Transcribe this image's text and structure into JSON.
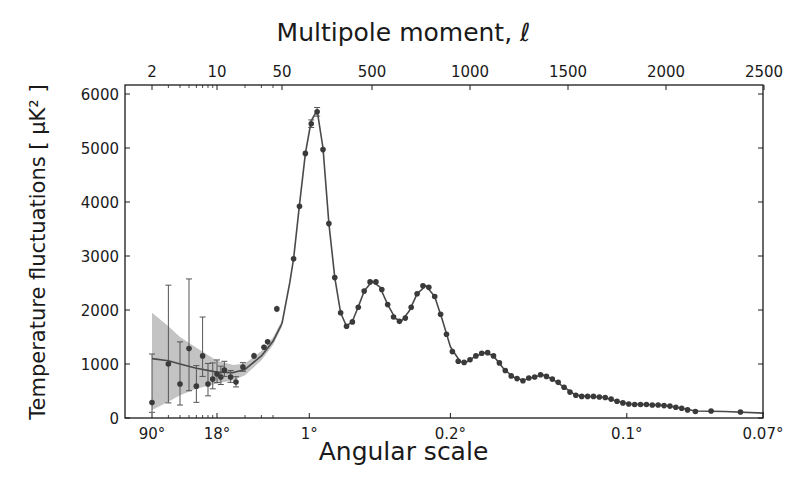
{
  "chart_data": {
    "type": "scatter",
    "title": "Multipole moment, ℓ",
    "top_xlabel": "Multipole moment, ℓ",
    "xlabel": "Angular scale",
    "ylabel": "Temperature fluctuations [ μK² ]",
    "ylim": [
      0,
      6200
    ],
    "xscale": "log for ℓ ≤ 50, linear for ℓ > 50",
    "xlim": [
      2,
      2500
    ],
    "grid": false,
    "top_ticks": [
      {
        "label": "2",
        "l": 2
      },
      {
        "label": "10",
        "l": 10
      },
      {
        "label": "50",
        "l": 50
      },
      {
        "label": "500",
        "l": 500
      },
      {
        "label": "1000",
        "l": 1000
      },
      {
        "label": "1500",
        "l": 1500
      },
      {
        "label": "2000",
        "l": 2000
      },
      {
        "label": "2500",
        "l": 2500
      }
    ],
    "bottom_ticks": [
      {
        "label": "90°",
        "l": 2
      },
      {
        "label": "18°",
        "l": 10
      },
      {
        "label": "1°",
        "l": 180
      },
      {
        "label": "0.2°",
        "l": 900
      },
      {
        "label": "0.1°",
        "l": 1800
      },
      {
        "label": "0.07°",
        "l": 2500
      }
    ],
    "y_ticks": [
      0,
      1000,
      2000,
      3000,
      4000,
      5000,
      6000
    ],
    "series": [
      {
        "name": "Measured power spectrum (data points with error bars)",
        "style": "dark gray circles",
        "points": [
          {
            "l": 2,
            "D": 285,
            "err_lo": 180,
            "err_hi": 900
          },
          {
            "l": 3,
            "D": 1000,
            "err_lo": 720,
            "err_hi": 1460
          },
          {
            "l": 4,
            "D": 630,
            "err_lo": 390,
            "err_hi": 780
          },
          {
            "l": 5,
            "D": 1285,
            "err_lo": 780,
            "err_hi": 1290
          },
          {
            "l": 6,
            "D": 590,
            "err_lo": 300,
            "err_hi": 380
          },
          {
            "l": 7,
            "D": 1150,
            "err_lo": 380,
            "err_hi": 720
          },
          {
            "l": 8,
            "D": 630,
            "err_lo": 220,
            "err_hi": 380
          },
          {
            "l": 9,
            "D": 720,
            "err_lo": 180,
            "err_hi": 300
          },
          {
            "l": 10,
            "D": 815,
            "err_lo": 160,
            "err_hi": 260
          },
          {
            "l": 11,
            "D": 760,
            "err_lo": 140,
            "err_hi": 200
          },
          {
            "l": 12,
            "D": 890,
            "err_lo": 120,
            "err_hi": 160
          },
          {
            "l": 14,
            "D": 760,
            "err_lo": 100,
            "err_hi": 120
          },
          {
            "l": 16,
            "D": 665,
            "err_lo": 90,
            "err_hi": 100
          },
          {
            "l": 19,
            "D": 945,
            "err_lo": 80,
            "err_hi": 80
          },
          {
            "l": 25,
            "D": 1150,
            "err_lo": 60,
            "err_hi": 60
          },
          {
            "l": 32,
            "D": 1310,
            "err_lo": 50,
            "err_hi": 50
          },
          {
            "l": 35,
            "D": 1410,
            "err_lo": 50,
            "err_hi": 50
          },
          {
            "l": 44,
            "D": 2020,
            "err_lo": 60,
            "err_hi": 60
          },
          {
            "l": 100,
            "D": 2950,
            "err_lo": 50,
            "err_hi": 50
          },
          {
            "l": 130,
            "D": 3920,
            "err_lo": 60,
            "err_hi": 60
          },
          {
            "l": 160,
            "D": 4900,
            "err_lo": 60,
            "err_hi": 60
          },
          {
            "l": 190,
            "D": 5450,
            "err_lo": 70,
            "err_hi": 70
          },
          {
            "l": 220,
            "D": 5670,
            "err_lo": 80,
            "err_hi": 80
          },
          {
            "l": 250,
            "D": 4970,
            "err_lo": 60,
            "err_hi": 60
          },
          {
            "l": 280,
            "D": 3600,
            "err_lo": 50,
            "err_hi": 50
          },
          {
            "l": 310,
            "D": 2600,
            "err_lo": 40,
            "err_hi": 40
          },
          {
            "l": 340,
            "D": 1950,
            "err_lo": 40,
            "err_hi": 40
          },
          {
            "l": 370,
            "D": 1700,
            "err_lo": 30,
            "err_hi": 30
          },
          {
            "l": 400,
            "D": 1780,
            "err_lo": 30,
            "err_hi": 30
          },
          {
            "l": 430,
            "D": 2050,
            "err_lo": 30,
            "err_hi": 30
          },
          {
            "l": 460,
            "D": 2350,
            "err_lo": 30,
            "err_hi": 30
          },
          {
            "l": 490,
            "D": 2520,
            "err_lo": 30,
            "err_hi": 30
          },
          {
            "l": 520,
            "D": 2520,
            "err_lo": 30,
            "err_hi": 30
          },
          {
            "l": 550,
            "D": 2380,
            "err_lo": 30,
            "err_hi": 30
          },
          {
            "l": 580,
            "D": 2100,
            "err_lo": 30,
            "err_hi": 30
          },
          {
            "l": 610,
            "D": 1870,
            "err_lo": 30,
            "err_hi": 30
          },
          {
            "l": 640,
            "D": 1790,
            "err_lo": 30,
            "err_hi": 30
          },
          {
            "l": 670,
            "D": 1850,
            "err_lo": 30,
            "err_hi": 30
          },
          {
            "l": 700,
            "D": 2050,
            "err_lo": 30,
            "err_hi": 30
          },
          {
            "l": 730,
            "D": 2300,
            "err_lo": 30,
            "err_hi": 30
          },
          {
            "l": 760,
            "D": 2450,
            "err_lo": 30,
            "err_hi": 30
          },
          {
            "l": 790,
            "D": 2420,
            "err_lo": 30,
            "err_hi": 30
          },
          {
            "l": 820,
            "D": 2250,
            "err_lo": 30,
            "err_hi": 30
          },
          {
            "l": 850,
            "D": 1920,
            "err_lo": 30,
            "err_hi": 30
          },
          {
            "l": 880,
            "D": 1550,
            "err_lo": 30,
            "err_hi": 30
          },
          {
            "l": 910,
            "D": 1230,
            "err_lo": 30,
            "err_hi": 30
          },
          {
            "l": 940,
            "D": 1050,
            "err_lo": 30,
            "err_hi": 30
          },
          {
            "l": 970,
            "D": 1030,
            "err_lo": 30,
            "err_hi": 30
          },
          {
            "l": 1000,
            "D": 1080,
            "err_lo": 30,
            "err_hi": 30
          },
          {
            "l": 1030,
            "D": 1150,
            "err_lo": 30,
            "err_hi": 30
          },
          {
            "l": 1060,
            "D": 1200,
            "err_lo": 30,
            "err_hi": 30
          },
          {
            "l": 1090,
            "D": 1210,
            "err_lo": 30,
            "err_hi": 30
          },
          {
            "l": 1120,
            "D": 1150,
            "err_lo": 30,
            "err_hi": 30
          },
          {
            "l": 1150,
            "D": 1020,
            "err_lo": 30,
            "err_hi": 30
          },
          {
            "l": 1180,
            "D": 880,
            "err_lo": 30,
            "err_hi": 30
          },
          {
            "l": 1210,
            "D": 780,
            "err_lo": 30,
            "err_hi": 30
          },
          {
            "l": 1240,
            "D": 730,
            "err_lo": 30,
            "err_hi": 30
          },
          {
            "l": 1270,
            "D": 690,
            "err_lo": 30,
            "err_hi": 30
          },
          {
            "l": 1300,
            "D": 740,
            "err_lo": 30,
            "err_hi": 30
          },
          {
            "l": 1330,
            "D": 760,
            "err_lo": 30,
            "err_hi": 30
          },
          {
            "l": 1360,
            "D": 800,
            "err_lo": 30,
            "err_hi": 30
          },
          {
            "l": 1390,
            "D": 770,
            "err_lo": 30,
            "err_hi": 30
          },
          {
            "l": 1420,
            "D": 720,
            "err_lo": 30,
            "err_hi": 30
          },
          {
            "l": 1450,
            "D": 660,
            "err_lo": 30,
            "err_hi": 30
          },
          {
            "l": 1480,
            "D": 570,
            "err_lo": 30,
            "err_hi": 30
          },
          {
            "l": 1510,
            "D": 480,
            "err_lo": 30,
            "err_hi": 30
          },
          {
            "l": 1540,
            "D": 420,
            "err_lo": 30,
            "err_hi": 30
          },
          {
            "l": 1570,
            "D": 400,
            "err_lo": 30,
            "err_hi": 30
          },
          {
            "l": 1600,
            "D": 400,
            "err_lo": 30,
            "err_hi": 30
          },
          {
            "l": 1630,
            "D": 400,
            "err_lo": 30,
            "err_hi": 30
          },
          {
            "l": 1660,
            "D": 390,
            "err_lo": 30,
            "err_hi": 30
          },
          {
            "l": 1690,
            "D": 380,
            "err_lo": 30,
            "err_hi": 30
          },
          {
            "l": 1720,
            "D": 350,
            "err_lo": 30,
            "err_hi": 30
          },
          {
            "l": 1750,
            "D": 310,
            "err_lo": 30,
            "err_hi": 30
          },
          {
            "l": 1780,
            "D": 280,
            "err_lo": 30,
            "err_hi": 30
          },
          {
            "l": 1810,
            "D": 260,
            "err_lo": 30,
            "err_hi": 30
          },
          {
            "l": 1840,
            "D": 250,
            "err_lo": 30,
            "err_hi": 30
          },
          {
            "l": 1870,
            "D": 250,
            "err_lo": 30,
            "err_hi": 30
          },
          {
            "l": 1900,
            "D": 250,
            "err_lo": 30,
            "err_hi": 30
          },
          {
            "l": 1930,
            "D": 240,
            "err_lo": 30,
            "err_hi": 30
          },
          {
            "l": 1960,
            "D": 240,
            "err_lo": 30,
            "err_hi": 30
          },
          {
            "l": 1990,
            "D": 230,
            "err_lo": 30,
            "err_hi": 30
          },
          {
            "l": 2020,
            "D": 220,
            "err_lo": 30,
            "err_hi": 30
          },
          {
            "l": 2050,
            "D": 200,
            "err_lo": 30,
            "err_hi": 30
          },
          {
            "l": 2080,
            "D": 180,
            "err_lo": 30,
            "err_hi": 30
          },
          {
            "l": 2110,
            "D": 150,
            "err_lo": 30,
            "err_hi": 30
          },
          {
            "l": 2150,
            "D": 120,
            "err_lo": 30,
            "err_hi": 30
          },
          {
            "l": 2230,
            "D": 130,
            "err_lo": 30,
            "err_hi": 30
          },
          {
            "l": 2380,
            "D": 110,
            "err_lo": 30,
            "err_hi": 30
          }
        ]
      },
      {
        "name": "Best-fit model",
        "style": "dark gray line with light gray cosmic-variance band",
        "curve": [
          {
            "l": 2,
            "D": 1100,
            "band_lo": 150,
            "band_hi": 1950
          },
          {
            "l": 3,
            "D": 1060,
            "band_lo": 300,
            "band_hi": 1700
          },
          {
            "l": 4,
            "D": 1000,
            "band_lo": 420,
            "band_hi": 1500
          },
          {
            "l": 6,
            "D": 920,
            "band_lo": 540,
            "band_hi": 1300
          },
          {
            "l": 10,
            "D": 850,
            "band_lo": 640,
            "band_hi": 1060
          },
          {
            "l": 15,
            "D": 840,
            "band_lo": 700,
            "band_hi": 980
          },
          {
            "l": 20,
            "D": 900,
            "band_lo": 790,
            "band_hi": 1010
          },
          {
            "l": 30,
            "D": 1150,
            "band_lo": 1070,
            "band_hi": 1240
          },
          {
            "l": 40,
            "D": 1420,
            "band_lo": 1350,
            "band_hi": 1490
          },
          {
            "l": 50,
            "D": 1750,
            "band_lo": 1690,
            "band_hi": 1810
          },
          {
            "l": 80,
            "D": 2500
          },
          {
            "l": 100,
            "D": 2950
          },
          {
            "l": 130,
            "D": 3950
          },
          {
            "l": 160,
            "D": 4900
          },
          {
            "l": 190,
            "D": 5500
          },
          {
            "l": 220,
            "D": 5700
          },
          {
            "l": 250,
            "D": 5000
          },
          {
            "l": 280,
            "D": 3600
          },
          {
            "l": 310,
            "D": 2600
          },
          {
            "l": 340,
            "D": 1950
          },
          {
            "l": 370,
            "D": 1700
          },
          {
            "l": 400,
            "D": 1790
          },
          {
            "l": 430,
            "D": 2060
          },
          {
            "l": 460,
            "D": 2350
          },
          {
            "l": 500,
            "D": 2530
          },
          {
            "l": 540,
            "D": 2430
          },
          {
            "l": 580,
            "D": 2100
          },
          {
            "l": 620,
            "D": 1840
          },
          {
            "l": 650,
            "D": 1790
          },
          {
            "l": 690,
            "D": 1980
          },
          {
            "l": 730,
            "D": 2300
          },
          {
            "l": 775,
            "D": 2450
          },
          {
            "l": 820,
            "D": 2250
          },
          {
            "l": 860,
            "D": 1800
          },
          {
            "l": 900,
            "D": 1320
          },
          {
            "l": 950,
            "D": 1040
          },
          {
            "l": 980,
            "D": 1030
          },
          {
            "l": 1030,
            "D": 1150
          },
          {
            "l": 1080,
            "D": 1215
          },
          {
            "l": 1120,
            "D": 1150
          },
          {
            "l": 1170,
            "D": 920
          },
          {
            "l": 1220,
            "D": 760
          },
          {
            "l": 1270,
            "D": 700
          },
          {
            "l": 1320,
            "D": 750
          },
          {
            "l": 1370,
            "D": 800
          },
          {
            "l": 1420,
            "D": 720
          },
          {
            "l": 1480,
            "D": 570
          },
          {
            "l": 1540,
            "D": 420
          },
          {
            "l": 1600,
            "D": 400
          },
          {
            "l": 1680,
            "D": 385
          },
          {
            "l": 1750,
            "D": 310
          },
          {
            "l": 1810,
            "D": 260
          },
          {
            "l": 1900,
            "D": 250
          },
          {
            "l": 2000,
            "D": 230
          },
          {
            "l": 2080,
            "D": 180
          },
          {
            "l": 2150,
            "D": 130
          },
          {
            "l": 2300,
            "D": 120
          },
          {
            "l": 2500,
            "D": 90
          }
        ]
      }
    ]
  },
  "labels": {
    "top_axis_title": "Multipole moment, ℓ",
    "bottom_axis_title": "Angular scale",
    "y_axis_title": "Temperature fluctuations [ μK² ]"
  },
  "colors": {
    "points": "#3a3a3a",
    "line": "#4a4a4a",
    "band": "#bdbdbd",
    "axes": "#1a1a1a"
  }
}
